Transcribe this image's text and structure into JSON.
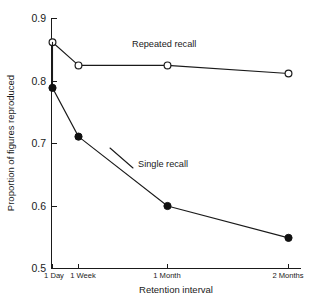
{
  "chart_data": {
    "type": "line",
    "title": "",
    "subtitle": "",
    "xlabel": "Retention interval",
    "ylabel": "Proportion of figures reproduced",
    "categories": [
      "1 Day",
      "1 Week",
      "1 Month",
      "2 Months"
    ],
    "x_positions": [
      0,
      1,
      7,
      60
    ],
    "xlim": [
      0,
      64
    ],
    "ylim": [
      0.5,
      0.9
    ],
    "y_ticks": [
      "0.5",
      "0.6",
      "0.7",
      "0.8",
      "0.9"
    ],
    "y_tick_values": [
      0.5,
      0.6,
      0.7,
      0.8,
      0.9
    ],
    "grid": false,
    "legend": "inline-annotation",
    "series": [
      {
        "name": "Repeated recall",
        "marker": "open-circle",
        "values": [
          0.862,
          0.825,
          0.825,
          0.812
        ],
        "label_x": 132,
        "label_y": 47
      },
      {
        "name": "Single recall",
        "marker": "filled-circle",
        "values": [
          0.789,
          0.711,
          0.6,
          0.549
        ],
        "label_x": 138,
        "label_y": 164
      }
    ],
    "shared_origin_point": {
      "note": "Both curves originate at the 1 Day open marker value",
      "value": 0.862
    },
    "colors": {
      "line": "#1a1a1a",
      "marker_fill_open": "#ffffff",
      "marker_fill_solid": "#111111",
      "axis": "#1a1a1a",
      "background": "#ffffff",
      "text": "#1a1a1a"
    }
  },
  "annotations": {
    "repeated_label": "Repeated recall",
    "single_label": "Single recall"
  },
  "axes": {
    "y_title": "Proportion of figures reproduced",
    "x_title": "Retention interval",
    "y_tick_0": "0.5",
    "y_tick_1": "0.6",
    "y_tick_2": "0.7",
    "y_tick_3": "0.8",
    "y_tick_4": "0.9",
    "x_tick_0": "1 Day",
    "x_tick_1": "1 Week",
    "x_tick_2": "1 Month",
    "x_tick_3": "2 Months"
  }
}
